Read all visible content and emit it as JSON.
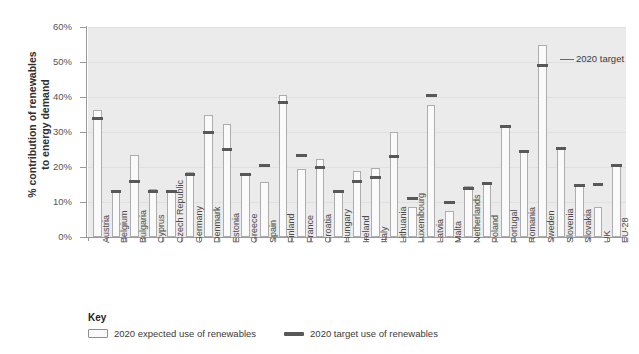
{
  "chart_data": {
    "type": "bar",
    "title": "",
    "xlabel": "",
    "ylabel": "% contribution of renewables\nto energy demand",
    "ylim": [
      0,
      60
    ],
    "ytick_labels": [
      "0%",
      "10%",
      "20%",
      "30%",
      "40%",
      "50%",
      "60%"
    ],
    "ytick_values": [
      0,
      10,
      20,
      30,
      40,
      50,
      60
    ],
    "grid": true,
    "legend_position": "bottom",
    "categories": [
      "Austria",
      "Belgium",
      "Bulgaria",
      "Cyprus",
      "Czech Republic",
      "Germany",
      "Denmark",
      "Estonia",
      "Greece",
      "Spain",
      "Finland",
      "France",
      "Croatia",
      "Hungary",
      "Ireland",
      "Italy",
      "Lithuania",
      "Luxembourg",
      "Latvia",
      "Malta",
      "Netherlands",
      "Poland",
      "Portugal",
      "Romania",
      "Sweden",
      "Slovenia",
      "Slovakia",
      "UK",
      "EU-28"
    ],
    "series": [
      {
        "name": "2020 expected use of renewables",
        "values": [
          36.4,
          12.8,
          23.5,
          13.8,
          13.5,
          18.7,
          34.9,
          32.2,
          17.6,
          15.6,
          40.5,
          19.4,
          22.2,
          13.0,
          18.9,
          19.7,
          29.9,
          8.7,
          37.6,
          7.5,
          14.5,
          15.3,
          31.6,
          24.4,
          55.0,
          25.3,
          14.6,
          8.7,
          20.5
        ]
      },
      {
        "name": "2020 target use of renewables",
        "values": [
          34.0,
          13.0,
          16.0,
          13.0,
          13.0,
          18.0,
          30.0,
          25.0,
          18.0,
          20.4,
          38.4,
          23.4,
          20.0,
          13.0,
          16.0,
          17.0,
          23.0,
          11.0,
          40.4,
          10.0,
          14.0,
          15.3,
          31.6,
          24.4,
          49.0,
          25.3,
          14.6,
          15.0,
          20.5
        ]
      }
    ],
    "annotations": [
      {
        "text": "2020 target",
        "points_to": "Sweden target marker"
      }
    ]
  },
  "key": {
    "title": "Key",
    "entries": [
      {
        "label": "2020 expected use of renewables",
        "swatch": "hollow-bar-swatch",
        "color": "#fafafa"
      },
      {
        "label": "2020 target use of renewables",
        "swatch": "dark-dash-swatch",
        "color": "#585858"
      }
    ]
  },
  "colors": {
    "plot_background": "#ebebeb",
    "expected_fill": "#fafafa",
    "expected_stroke": "#adadad",
    "target": "#585858",
    "axis": "#9a9a9a",
    "text": "#3b3b3b"
  }
}
